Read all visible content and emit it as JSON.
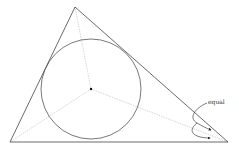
{
  "diagram": {
    "triangle": {
      "A": [
        75,
        7
      ],
      "B": [
        10,
        142
      ],
      "C": [
        228,
        142
      ],
      "stroke": "#444444"
    },
    "incircle": {
      "cx": 91,
      "cy": 89,
      "r": 50,
      "stroke": "#555555"
    },
    "incenter": [
      91,
      89
    ],
    "bisectors": {
      "stroke": "#bbbbbb"
    },
    "annotation": {
      "text": "equal"
    }
  }
}
